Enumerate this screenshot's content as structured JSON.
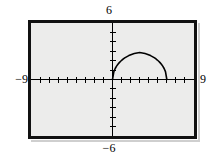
{
  "figure": {
    "kind": "graphing-calculator-screen",
    "background_color": "#ececeb",
    "frame_color": "#111111",
    "ink_color": "#000000"
  },
  "window_labels": {
    "ymax": "6",
    "ymin": "−6",
    "xmin": "−9",
    "xmax": "9"
  },
  "chart_data": {
    "type": "line",
    "title": "",
    "xlabel": "",
    "ylabel": "",
    "xlim": [
      -9,
      9
    ],
    "ylim": [
      -6,
      6
    ],
    "grid": false,
    "legend": null,
    "axes": {
      "x_axis_at_y": 0,
      "y_axis_at_x": 0,
      "x_tick_interval": 1,
      "y_tick_interval": 1,
      "x_tick_values": [
        -8,
        -7,
        -6,
        -5,
        -4,
        -3,
        -2,
        -1,
        1,
        2,
        3,
        4,
        5,
        6,
        7,
        8
      ],
      "y_tick_values": [
        -5,
        -4,
        -3,
        -2,
        -1,
        1,
        2,
        3,
        4,
        5
      ],
      "tick_length_px": 3
    },
    "series": [
      {
        "name": "semicircle-arc",
        "description": "upper semicircular arc, center (3,0), radius 3",
        "color": "#000000",
        "x": [
          0.0,
          0.15,
          0.3,
          0.45,
          0.6,
          0.75,
          0.9,
          1.05,
          1.2,
          1.35,
          1.5,
          1.65,
          1.8,
          1.95,
          2.1,
          2.25,
          2.4,
          2.55,
          2.7,
          2.85,
          3.0,
          3.15,
          3.3,
          3.45,
          3.6,
          3.75,
          3.9,
          4.05,
          4.2,
          4.35,
          4.5,
          4.65,
          4.8,
          4.95,
          5.1,
          5.25,
          5.4,
          5.55,
          5.7,
          5.85,
          6.0
        ],
        "y": [
          0.0,
          0.84,
          1.17,
          1.42,
          1.62,
          1.79,
          1.94,
          2.07,
          2.18,
          2.29,
          2.38,
          2.46,
          2.54,
          2.6,
          2.66,
          2.71,
          2.75,
          2.79,
          2.82,
          2.84,
          2.85,
          2.84,
          2.82,
          2.79,
          2.75,
          2.71,
          2.66,
          2.6,
          2.54,
          2.46,
          2.38,
          2.29,
          2.18,
          2.07,
          1.94,
          1.79,
          1.62,
          1.42,
          1.17,
          0.84,
          0.0
        ]
      }
    ]
  }
}
